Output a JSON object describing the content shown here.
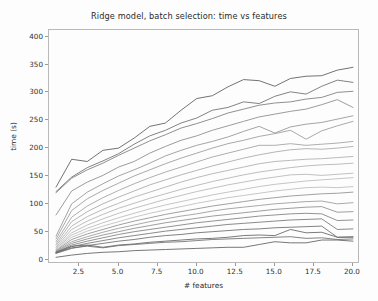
{
  "figure": {
    "background_color": "#fdfdfd",
    "axes_border_color": "#b9b9b9",
    "tick_color": "#9a9a9a",
    "text_color": "#2b2b2b"
  },
  "chart_data": {
    "type": "line",
    "title": "Ridge model, batch selection: time vs features",
    "xlabel": "# features",
    "ylabel": "time (s)",
    "xlim": [
      0.55,
      20.45
    ],
    "ylim": [
      -8,
      412
    ],
    "grid": false,
    "legend": null,
    "legend_position": "none",
    "xticks": [
      2.5,
      5.0,
      7.5,
      10.0,
      12.5,
      15.0,
      17.5,
      20.0
    ],
    "xtick_labels": [
      "2.5",
      "5.0",
      "7.5",
      "10.0",
      "12.5",
      "15.0",
      "17.5",
      "20.0"
    ],
    "yticks": [
      0,
      50,
      100,
      150,
      200,
      250,
      300,
      350,
      400
    ],
    "ytick_labels": [
      "0",
      "50",
      "100",
      "150",
      "200",
      "250",
      "300",
      "350",
      "400"
    ],
    "x": [
      1,
      2,
      3,
      4,
      5,
      6,
      7,
      8,
      9,
      10,
      11,
      12,
      13,
      14,
      15,
      16,
      17,
      18,
      19,
      20
    ],
    "series": [
      {
        "name": "batch 1",
        "color": "#5a5a5a",
        "values": [
          130,
          180,
          176,
          196,
          200,
          218,
          239,
          245,
          268,
          289,
          294,
          310,
          323,
          321,
          311,
          325,
          329,
          330,
          340,
          345
        ]
      },
      {
        "name": "batch 2",
        "color": "#6d6d6d",
        "values": [
          122,
          148,
          165,
          177,
          190,
          207,
          222,
          232,
          245,
          254,
          268,
          273,
          283,
          280,
          293,
          301,
          297,
          311,
          322,
          318
        ]
      },
      {
        "name": "batch 3",
        "color": "#7c7c7c",
        "values": [
          120,
          146,
          161,
          173,
          187,
          200,
          213,
          224,
          236,
          244,
          253,
          263,
          270,
          277,
          281,
          283,
          288,
          291,
          300,
          302
        ]
      },
      {
        "name": "batch 4",
        "color": "#8a8a8a",
        "values": [
          80,
          123,
          139,
          151,
          166,
          176,
          191,
          203,
          214,
          222,
          232,
          240,
          248,
          256,
          261,
          266,
          270,
          278,
          287,
          273
        ]
      },
      {
        "name": "batch 5",
        "color": "#939393",
        "values": [
          42,
          100,
          121,
          136,
          150,
          161,
          173,
          186,
          196,
          205,
          212,
          220,
          230,
          239,
          227,
          238,
          243,
          246,
          252,
          258
        ]
      },
      {
        "name": "batch 6",
        "color": "#9a9a9a",
        "values": [
          37,
          88,
          109,
          124,
          137,
          150,
          161,
          172,
          182,
          191,
          200,
          208,
          214,
          221,
          226,
          232,
          216,
          231,
          240,
          248
        ]
      },
      {
        "name": "batch 7",
        "color": "#a1a1a1",
        "values": [
          32,
          76,
          96,
          111,
          124,
          136,
          147,
          157,
          166,
          175,
          184,
          191,
          198,
          205,
          205,
          208,
          205,
          207,
          209,
          212
        ]
      },
      {
        "name": "batch 8",
        "color": "#a8a8a8",
        "values": [
          28,
          68,
          86,
          100,
          112,
          123,
          134,
          143,
          152,
          160,
          168,
          175,
          182,
          188,
          193,
          197,
          199,
          198,
          200,
          203
        ]
      },
      {
        "name": "batch 9",
        "color": "#adadad",
        "values": [
          25,
          60,
          77,
          90,
          101,
          112,
          121,
          130,
          139,
          147,
          154,
          160,
          166,
          172,
          176,
          178,
          180,
          181,
          183,
          185
        ]
      },
      {
        "name": "batch 10",
        "color": "#b2b2b2",
        "values": [
          22,
          54,
          69,
          81,
          92,
          101,
          110,
          118,
          126,
          133,
          140,
          146,
          152,
          157,
          161,
          165,
          168,
          170,
          171,
          173
        ]
      },
      {
        "name": "batch 11",
        "color": "#b6b6b6",
        "values": [
          20,
          48,
          62,
          73,
          83,
          92,
          100,
          108,
          115,
          122,
          128,
          134,
          139,
          144,
          148,
          152,
          153,
          151,
          153,
          155
        ]
      },
      {
        "name": "batch 12",
        "color": "#bababa",
        "values": [
          19,
          44,
          56,
          66,
          75,
          83,
          91,
          98,
          104,
          110,
          116,
          121,
          126,
          131,
          135,
          138,
          141,
          143,
          145,
          147
        ]
      },
      {
        "name": "batch 13",
        "color": "#bdbdbd",
        "values": [
          17,
          40,
          51,
          60,
          68,
          76,
          83,
          89,
          95,
          101,
          106,
          111,
          115,
          119,
          123,
          126,
          129,
          130,
          129,
          131
        ]
      },
      {
        "name": "batch 14",
        "color": "#909090",
        "values": [
          16,
          36,
          46,
          54,
          62,
          69,
          75,
          81,
          86,
          91,
          96,
          100,
          104,
          108,
          111,
          114,
          116,
          118,
          119,
          121
        ]
      },
      {
        "name": "batch 15",
        "color": "#999999",
        "values": [
          15,
          32,
          41,
          49,
          56,
          62,
          68,
          73,
          78,
          82,
          87,
          91,
          94,
          97,
          100,
          102,
          104,
          105,
          100,
          102
        ]
      },
      {
        "name": "batch 16",
        "color": "#8d8d8d",
        "values": [
          14,
          29,
          37,
          44,
          50,
          56,
          61,
          66,
          70,
          74,
          78,
          81,
          84,
          87,
          90,
          92,
          94,
          95,
          85,
          86
        ]
      },
      {
        "name": "batch 17",
        "color": "#7f7f7f",
        "values": [
          13,
          26,
          33,
          39,
          45,
          50,
          54,
          58,
          62,
          66,
          69,
          72,
          75,
          78,
          80,
          82,
          83,
          82,
          70,
          71
        ]
      },
      {
        "name": "batch 18",
        "color": "#757575",
        "values": [
          12,
          23,
          29,
          34,
          39,
          43,
          47,
          51,
          54,
          57,
          60,
          63,
          65,
          67,
          69,
          71,
          72,
          73,
          54,
          55
        ]
      },
      {
        "name": "batch 19",
        "color": "#6b6b6b",
        "values": [
          11,
          20,
          25,
          29,
          33,
          36,
          40,
          43,
          45,
          48,
          50,
          52,
          54,
          55,
          57,
          58,
          59,
          60,
          40,
          41
        ]
      },
      {
        "name": "batch 20",
        "color": "#636363",
        "values": [
          13,
          24,
          26,
          22,
          26,
          28,
          31,
          33,
          35,
          37,
          38,
          40,
          43,
          44,
          43,
          54,
          48,
          49,
          40,
          40
        ]
      },
      {
        "name": "batch 21",
        "color": "#6e6e6e",
        "values": [
          12,
          21,
          24,
          21,
          25,
          27,
          29,
          31,
          32,
          34,
          36,
          37,
          38,
          39,
          40,
          41,
          38,
          39,
          36,
          37
        ]
      },
      {
        "name": "batch 22",
        "color": "#5f5f5f",
        "values": [
          4,
          8,
          11,
          13,
          14,
          16,
          17,
          18,
          19,
          20,
          21,
          22,
          22,
          27,
          32,
          30,
          30,
          35,
          35,
          33
        ]
      }
    ]
  }
}
